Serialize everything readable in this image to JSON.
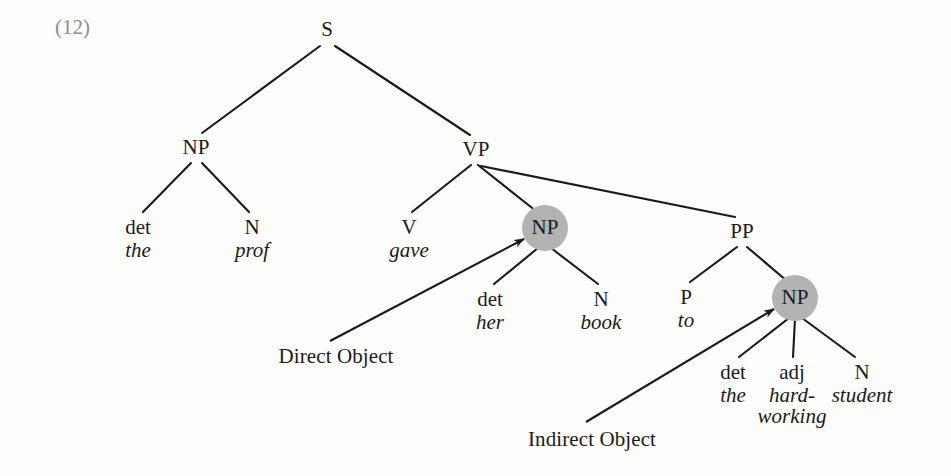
{
  "figure": {
    "example_number": "(12)",
    "sentence": "the prof gave her book to the hard-working student",
    "background_color": "#fdfdfc",
    "ink_color": "#1a1a1a",
    "highlight_color": "#b3b3b3",
    "example_number_color": "#8c8c8c"
  },
  "nodes": {
    "s": {
      "label": "S",
      "x": 327,
      "y": 30
    },
    "np_subject": {
      "label": "NP",
      "x": 196,
      "y": 148
    },
    "vp": {
      "label": "VP",
      "x": 476,
      "y": 150
    },
    "det_the1": {
      "label": "det",
      "x": 138,
      "y": 228
    },
    "the1": {
      "label": "the",
      "x": 138,
      "y": 250
    },
    "n_prof": {
      "label": "N",
      "x": 252,
      "y": 228
    },
    "prof": {
      "label": "prof",
      "x": 252,
      "y": 250
    },
    "v_gave": {
      "label": "V",
      "x": 409,
      "y": 228
    },
    "gave": {
      "label": "gave",
      "x": 409,
      "y": 250
    },
    "np_direct": {
      "label": "NP",
      "x": 545,
      "y": 228,
      "highlighted": true
    },
    "det_her": {
      "label": "det",
      "x": 490,
      "y": 300
    },
    "her": {
      "label": "her",
      "x": 490,
      "y": 322
    },
    "n_book": {
      "label": "N",
      "x": 601,
      "y": 300
    },
    "book": {
      "label": "book",
      "x": 601,
      "y": 322
    },
    "pp": {
      "label": "PP",
      "x": 742,
      "y": 232
    },
    "p_to": {
      "label": "P",
      "x": 686,
      "y": 298
    },
    "to": {
      "label": "to",
      "x": 686,
      "y": 320
    },
    "np_indirect": {
      "label": "NP",
      "x": 795,
      "y": 298,
      "highlighted": true
    },
    "det_the2": {
      "label": "det",
      "x": 733,
      "y": 373
    },
    "the2": {
      "label": "the",
      "x": 733,
      "y": 395
    },
    "adj_hardworking": {
      "label": "adj",
      "x": 792,
      "y": 373
    },
    "hard": {
      "label": "hard-",
      "x": 792,
      "y": 395
    },
    "working": {
      "label": "working",
      "x": 792,
      "y": 417
    },
    "n_student": {
      "label": "N",
      "x": 862,
      "y": 373
    },
    "student": {
      "label": "student",
      "x": 862,
      "y": 395
    }
  },
  "annotations": [
    {
      "id": "direct-object",
      "label": "Direct Object",
      "x": 336,
      "y": 357,
      "arrow": {
        "x1": 330,
        "y1": 341,
        "x2": 524,
        "y2": 239
      }
    },
    {
      "id": "indirect-object",
      "label": "Indirect Object",
      "x": 592,
      "y": 440,
      "arrow": {
        "x1": 586,
        "y1": 422,
        "x2": 774,
        "y2": 309
      }
    }
  ],
  "edges": [
    {
      "from": "s",
      "to": "np_subject"
    },
    {
      "from": "s",
      "to": "vp"
    },
    {
      "from": "np_subject",
      "to": "det_the1"
    },
    {
      "from": "np_subject",
      "to": "n_prof"
    },
    {
      "from": "vp",
      "to": "v_gave"
    },
    {
      "from": "vp",
      "to": "np_direct"
    },
    {
      "from": "vp",
      "to": "pp"
    },
    {
      "from": "np_direct",
      "to": "det_her"
    },
    {
      "from": "np_direct",
      "to": "n_book"
    },
    {
      "from": "pp",
      "to": "p_to"
    },
    {
      "from": "pp",
      "to": "np_indirect"
    },
    {
      "from": "np_indirect",
      "to": "det_the2"
    },
    {
      "from": "np_indirect",
      "to": "adj_hardworking"
    },
    {
      "from": "np_indirect",
      "to": "n_student"
    }
  ]
}
